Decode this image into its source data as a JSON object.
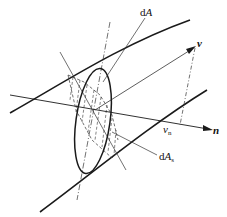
{
  "diagram": {
    "type": "flow-tube-cross-section",
    "colors": {
      "stroke": "#1a1a1a",
      "thin": "#333333",
      "background": "#ffffff"
    },
    "labels": {
      "dA": {
        "prefix": "d",
        "var": "A"
      },
      "dAs": {
        "prefix": "d",
        "var": "A",
        "sub": "s"
      },
      "v": "v",
      "vn": {
        "var": "v",
        "sub": "n"
      },
      "n": "n"
    }
  }
}
